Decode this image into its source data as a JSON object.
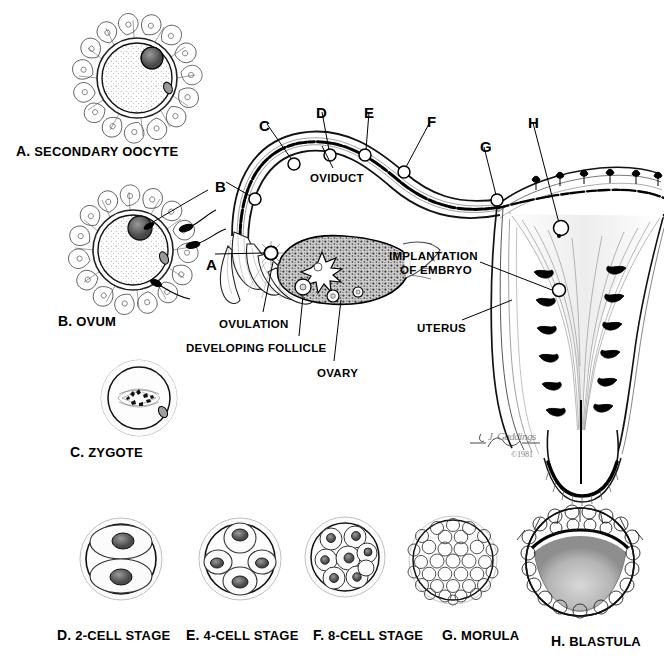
{
  "figure": {
    "copyright": "©1981",
    "signature": "J. Gaddings"
  },
  "stages": [
    {
      "letter": "A.",
      "name": "SECONDARY OOCYTE",
      "x": 16,
      "y": 143,
      "cell": {
        "cx": 137,
        "cy": 78,
        "r": 44,
        "type": "oocyte-corona"
      }
    },
    {
      "letter": "B.",
      "name": "OVUM",
      "x": 58,
      "y": 313,
      "cell": {
        "cx": 135,
        "cy": 250,
        "r": 44,
        "type": "ovum-sperm"
      }
    },
    {
      "letter": "C.",
      "name": "ZYGOTE",
      "x": 70,
      "y": 444,
      "cell": {
        "cx": 139,
        "cy": 398,
        "r": 38,
        "type": "zygote"
      }
    },
    {
      "letter": "D.",
      "name": "2-CELL STAGE",
      "x": 57,
      "y": 627,
      "cell": {
        "cx": 121,
        "cy": 559,
        "r": 41,
        "type": "two-cell"
      }
    },
    {
      "letter": "E.",
      "name": "4-CELL STAGE",
      "x": 186,
      "y": 627,
      "cell": {
        "cx": 240,
        "cy": 559,
        "r": 41,
        "type": "four-cell"
      }
    },
    {
      "letter": "F.",
      "name": "8-CELL STAGE",
      "x": 313,
      "y": 627,
      "cell": {
        "cx": 345,
        "cy": 557,
        "r": 39,
        "type": "eight-cell"
      }
    },
    {
      "letter": "G.",
      "name": "MORULA",
      "x": 442,
      "y": 627,
      "cell": {
        "cx": 453,
        "cy": 560,
        "r": 41,
        "type": "morula"
      }
    },
    {
      "letter": "H.",
      "name": "BLASTULA",
      "x": 551,
      "y": 633,
      "cell": {
        "cx": 580,
        "cy": 562,
        "r": 53,
        "type": "blastula"
      }
    }
  ],
  "tract_labels": [
    {
      "text": "OVIDUCT",
      "x": 310,
      "y": 172,
      "align": "left"
    },
    {
      "text": "IMPLANTATION",
      "x": 389,
      "y": 250,
      "align": "left"
    },
    {
      "text": "OF EMBRYO",
      "x": 400,
      "y": 264,
      "align": "left"
    },
    {
      "text": "UTERUS",
      "x": 417,
      "y": 322,
      "align": "left"
    },
    {
      "text": "OVULATION",
      "x": 219,
      "y": 318,
      "align": "left"
    },
    {
      "text": "DEVELOPING FOLLICLE",
      "x": 186,
      "y": 342,
      "align": "left"
    },
    {
      "text": "OVARY",
      "x": 317,
      "y": 367,
      "align": "left"
    }
  ],
  "markers": [
    {
      "letter": "A",
      "label_x": 206,
      "label_y": 256,
      "dot_x": 271,
      "dot_y": 253
    },
    {
      "letter": "B",
      "label_x": 215,
      "label_y": 178,
      "dot_x": 255,
      "dot_y": 199
    },
    {
      "letter": "C",
      "label_x": 259,
      "label_y": 117,
      "dot_x": 294,
      "dot_y": 164
    },
    {
      "letter": "D",
      "label_x": 316,
      "label_y": 104,
      "dot_x": 330,
      "dot_y": 155
    },
    {
      "letter": "E",
      "label_x": 364,
      "label_y": 104,
      "dot_x": 365,
      "dot_y": 155
    },
    {
      "letter": "F",
      "label_x": 427,
      "label_y": 113,
      "dot_x": 404,
      "dot_y": 172
    },
    {
      "letter": "G",
      "label_x": 480,
      "label_y": 138,
      "dot_x": 497,
      "dot_y": 200
    },
    {
      "letter": "H",
      "label_x": 528,
      "label_y": 114,
      "dot_x": 561,
      "dot_y": 228
    }
  ],
  "colors": {
    "ink": "#000000",
    "paper": "#ffffff",
    "tissue_fill": "#9a9a9a",
    "light_tint": "#e8e8e8"
  }
}
